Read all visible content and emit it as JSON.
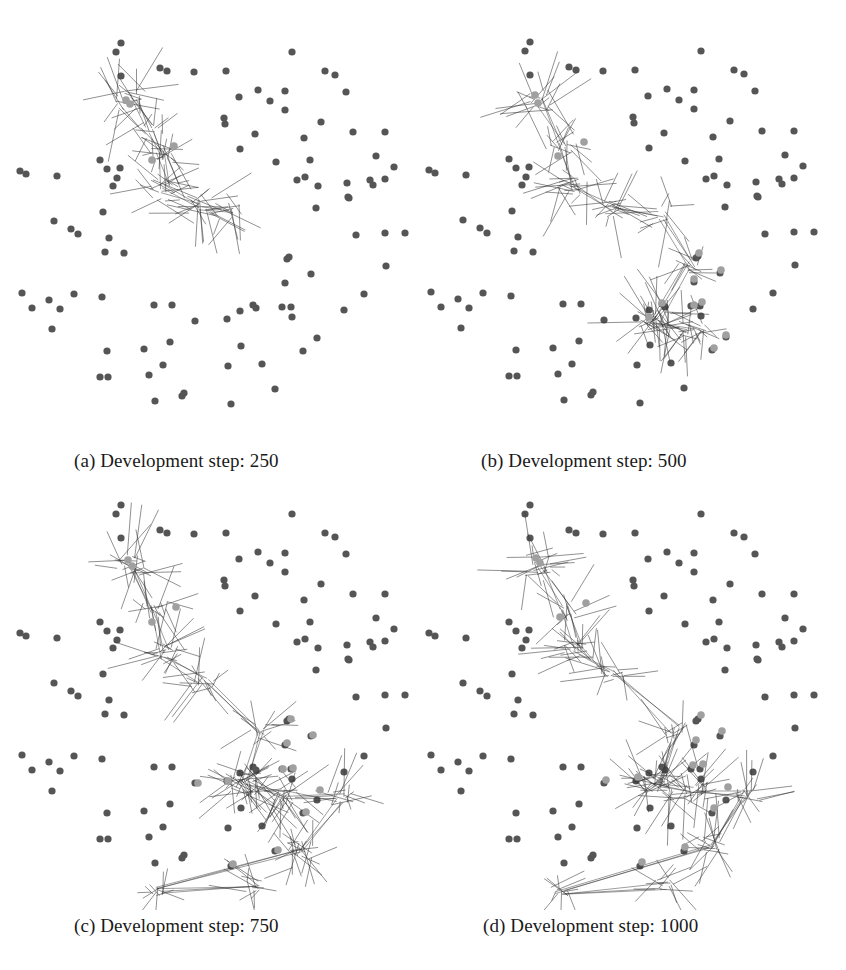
{
  "figure": {
    "colors": {
      "node": "#555555",
      "active_node": "#a0a0a0",
      "edge": "#3a3a3a",
      "background": "#ffffff"
    },
    "base_nodes": [
      [
        121,
        43
      ],
      [
        116,
        52
      ],
      [
        121,
        76
      ],
      [
        160,
        68
      ],
      [
        167,
        71
      ],
      [
        194,
        72
      ],
      [
        226,
        71
      ],
      [
        292,
        52
      ],
      [
        325,
        71
      ],
      [
        335,
        75
      ],
      [
        346,
        92
      ],
      [
        239,
        97
      ],
      [
        258,
        90
      ],
      [
        285,
        91
      ],
      [
        270,
        101
      ],
      [
        285,
        110
      ],
      [
        224,
        118
      ],
      [
        225,
        124
      ],
      [
        321,
        122
      ],
      [
        255,
        134
      ],
      [
        240,
        149
      ],
      [
        353,
        132
      ],
      [
        385,
        132
      ],
      [
        304,
        138
      ],
      [
        376,
        156
      ],
      [
        394,
        167
      ],
      [
        276,
        162
      ],
      [
        310,
        160
      ],
      [
        297,
        180
      ],
      [
        305,
        177
      ],
      [
        318,
        186
      ],
      [
        347,
        183
      ],
      [
        370,
        180
      ],
      [
        373,
        185
      ],
      [
        385,
        179
      ],
      [
        349,
        198
      ],
      [
        348,
        197
      ],
      [
        316,
        208
      ],
      [
        20,
        171
      ],
      [
        26,
        174
      ],
      [
        57,
        176
      ],
      [
        100,
        160
      ],
      [
        107,
        169
      ],
      [
        120,
        168
      ],
      [
        117,
        178
      ],
      [
        113,
        186
      ],
      [
        103,
        212
      ],
      [
        54,
        221
      ],
      [
        71,
        229
      ],
      [
        78,
        234
      ],
      [
        109,
        238
      ],
      [
        105,
        252
      ],
      [
        124,
        253
      ],
      [
        289,
        257
      ],
      [
        287,
        259
      ],
      [
        311,
        274
      ],
      [
        285,
        283
      ],
      [
        356,
        235
      ],
      [
        385,
        233
      ],
      [
        405,
        233
      ],
      [
        386,
        266
      ],
      [
        364,
        294
      ],
      [
        22,
        293
      ],
      [
        32,
        308
      ],
      [
        49,
        300
      ],
      [
        60,
        309
      ],
      [
        74,
        294
      ],
      [
        102,
        297
      ],
      [
        52,
        329
      ],
      [
        154,
        305
      ],
      [
        172,
        305
      ],
      [
        195,
        321
      ],
      [
        227,
        319
      ],
      [
        240,
        311
      ],
      [
        253,
        305
      ],
      [
        256,
        308
      ],
      [
        282,
        307
      ],
      [
        291,
        307
      ],
      [
        292,
        317
      ],
      [
        344,
        310
      ],
      [
        317,
        338
      ],
      [
        303,
        351
      ],
      [
        107,
        351
      ],
      [
        144,
        349
      ],
      [
        170,
        342
      ],
      [
        108,
        377
      ],
      [
        149,
        375
      ],
      [
        163,
        365
      ],
      [
        228,
        366
      ],
      [
        241,
        346
      ],
      [
        262,
        364
      ],
      [
        275,
        389
      ],
      [
        100,
        377
      ],
      [
        155,
        401
      ],
      [
        182,
        396
      ],
      [
        184,
        393
      ],
      [
        231,
        404
      ]
    ],
    "panels": [
      {
        "id": "a",
        "origin": [
          0,
          0
        ],
        "caption": "(a) Development step: 250",
        "caption_pos": [
          74,
          450
        ],
        "node_offset": [
          0,
          0
        ],
        "clusters": [
          {
            "cx": 130,
            "cy": 100,
            "r": 34,
            "n": 22
          },
          {
            "cx": 150,
            "cy": 130,
            "r": 28,
            "n": 14
          },
          {
            "cx": 160,
            "cy": 155,
            "r": 28,
            "n": 16
          },
          {
            "cx": 165,
            "cy": 190,
            "r": 34,
            "n": 22
          },
          {
            "cx": 200,
            "cy": 205,
            "r": 30,
            "n": 16
          },
          {
            "cx": 230,
            "cy": 210,
            "r": 34,
            "n": 12
          }
        ],
        "active_nodes": [
          [
            126,
            100
          ],
          [
            130,
            104
          ],
          [
            174,
            146
          ],
          [
            152,
            160
          ]
        ]
      },
      {
        "id": "b",
        "origin": [
          420,
          0
        ],
        "caption": "(b) Development step: 500",
        "caption_pos": [
          481,
          450
        ],
        "node_offset": [
          -11,
          -1
        ],
        "clusters": [
          {
            "cx": 120,
            "cy": 100,
            "r": 34,
            "n": 22
          },
          {
            "cx": 140,
            "cy": 145,
            "r": 28,
            "n": 14
          },
          {
            "cx": 152,
            "cy": 185,
            "r": 34,
            "n": 22
          },
          {
            "cx": 190,
            "cy": 210,
            "r": 30,
            "n": 16
          },
          {
            "cx": 240,
            "cy": 215,
            "r": 30,
            "n": 12
          },
          {
            "cx": 270,
            "cy": 265,
            "r": 26,
            "n": 12
          },
          {
            "cx": 235,
            "cy": 320,
            "r": 34,
            "n": 40
          },
          {
            "cx": 272,
            "cy": 330,
            "r": 30,
            "n": 26
          }
        ],
        "active_nodes": [
          [
            115,
            95
          ],
          [
            118,
            103
          ],
          [
            164,
            142
          ],
          [
            138,
            156
          ],
          [
            279,
            253
          ],
          [
            301,
            270
          ],
          [
            274,
            279
          ],
          [
            242,
            303
          ],
          [
            229,
            317
          ],
          [
            274,
            305
          ],
          [
            282,
            302
          ],
          [
            306,
            335
          ],
          [
            294,
            348
          ]
        ]
      },
      {
        "id": "c",
        "origin": [
          0,
          490
        ],
        "caption": "(c) Development step: 750",
        "caption_pos": [
          74,
          915
        ],
        "node_offset": [
          0,
          -28
        ],
        "clusters": [
          {
            "cx": 130,
            "cy": 75,
            "r": 34,
            "n": 22
          },
          {
            "cx": 155,
            "cy": 120,
            "r": 28,
            "n": 14
          },
          {
            "cx": 165,
            "cy": 165,
            "r": 34,
            "n": 22
          },
          {
            "cx": 205,
            "cy": 190,
            "r": 30,
            "n": 16
          },
          {
            "cx": 262,
            "cy": 240,
            "r": 26,
            "n": 12
          },
          {
            "cx": 245,
            "cy": 295,
            "r": 34,
            "n": 44
          },
          {
            "cx": 285,
            "cy": 305,
            "r": 30,
            "n": 26
          },
          {
            "cx": 340,
            "cy": 308,
            "r": 30,
            "n": 16
          },
          {
            "cx": 300,
            "cy": 360,
            "r": 30,
            "n": 22
          },
          {
            "cx": 160,
            "cy": 400,
            "r": 22,
            "n": 10
          },
          {
            "cx": 255,
            "cy": 395,
            "r": 24,
            "n": 14
          }
        ],
        "active_nodes": [
          [
            128,
            70
          ],
          [
            132,
            76
          ],
          [
            176,
            117
          ],
          [
            152,
            132
          ],
          [
            291,
            229
          ],
          [
            313,
            245
          ],
          [
            287,
            253
          ],
          [
            198,
            293
          ],
          [
            228,
            291
          ],
          [
            283,
            279
          ],
          [
            293,
            278
          ],
          [
            320,
            300
          ],
          [
            306,
            322
          ],
          [
            278,
            360
          ],
          [
            233,
            374
          ]
        ]
      },
      {
        "id": "d",
        "origin": [
          420,
          490
        ],
        "caption": "(d) Development step: 1000",
        "caption_pos": [
          483,
          915
        ],
        "node_offset": [
          -11,
          -28
        ],
        "clusters": [
          {
            "cx": 120,
            "cy": 75,
            "r": 34,
            "n": 22
          },
          {
            "cx": 145,
            "cy": 120,
            "r": 28,
            "n": 14
          },
          {
            "cx": 158,
            "cy": 160,
            "r": 34,
            "n": 22
          },
          {
            "cx": 192,
            "cy": 185,
            "r": 30,
            "n": 16
          },
          {
            "cx": 255,
            "cy": 240,
            "r": 26,
            "n": 12
          },
          {
            "cx": 238,
            "cy": 295,
            "r": 34,
            "n": 44
          },
          {
            "cx": 275,
            "cy": 300,
            "r": 30,
            "n": 26
          },
          {
            "cx": 328,
            "cy": 305,
            "r": 30,
            "n": 16
          },
          {
            "cx": 290,
            "cy": 355,
            "r": 30,
            "n": 22
          },
          {
            "cx": 140,
            "cy": 400,
            "r": 22,
            "n": 10
          },
          {
            "cx": 245,
            "cy": 395,
            "r": 24,
            "n": 14
          }
        ],
        "active_nodes": [
          [
            116,
            68
          ],
          [
            120,
            73
          ],
          [
            166,
            113
          ],
          [
            140,
            127
          ],
          [
            281,
            225
          ],
          [
            302,
            241
          ],
          [
            276,
            250
          ],
          [
            186,
            290
          ],
          [
            218,
            287
          ],
          [
            273,
            275
          ],
          [
            283,
            274
          ],
          [
            308,
            297
          ],
          [
            294,
            318
          ],
          [
            265,
            357
          ],
          [
            222,
            372
          ]
        ]
      }
    ]
  }
}
